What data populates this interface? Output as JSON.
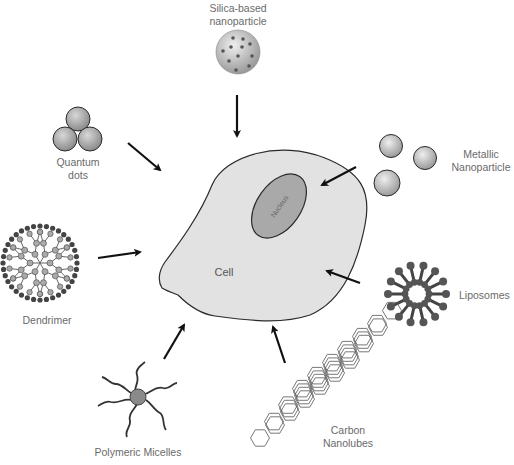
{
  "diagram": {
    "center": {
      "label": "Cell",
      "nucleus_label": "Nucleus"
    },
    "nanocarriers": [
      {
        "id": "silica",
        "line1": "Silica-based",
        "line2": "nanoparticle"
      },
      {
        "id": "quantum",
        "line1": "Quantum",
        "line2": "dots"
      },
      {
        "id": "metallic",
        "line1": "Metallic",
        "line2": "Nanoparticle"
      },
      {
        "id": "dendrimer",
        "line1": "Dendrimer",
        "line2": ""
      },
      {
        "id": "liposomes",
        "line1": "Liposomes",
        "line2": ""
      },
      {
        "id": "micelles",
        "line1": "Polymeric Micelles",
        "line2": ""
      },
      {
        "id": "carbon",
        "line1": "Carbon",
        "line2": "Nanolubes"
      }
    ],
    "colors": {
      "cell_fill": "#e2e2e2",
      "nucleus_fill": "#a9a9a9",
      "outline": "#2a2a2a",
      "arrow": "#111111",
      "label_text": "#6a6a6a"
    }
  }
}
